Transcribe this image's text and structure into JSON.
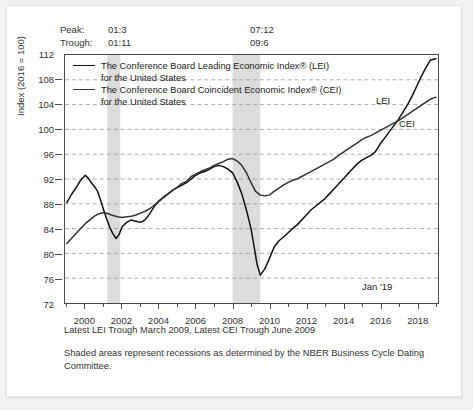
{
  "header": {
    "rows": [
      {
        "label": "Peak:",
        "col1": "01:3",
        "col2": "07:12"
      },
      {
        "label": "Trough:",
        "col1": "01:11",
        "col2": "09:6"
      }
    ]
  },
  "legend": {
    "entries": [
      {
        "line1": "The Conference Board Leading Economic Index® (LEI)",
        "line2": "for the United States",
        "color": "#111111"
      },
      {
        "line1": "The Conference Board Coincident Economic Index® (CEI)",
        "line2": "for the United States",
        "color": "#333333"
      }
    ]
  },
  "annotations": {
    "lei_tag": "LEI",
    "cei_tag": "CEI",
    "last_point": "Jan '19"
  },
  "footnotes": {
    "line1": "Latest LEI Trough March 2009, Latest CEI Trough June 2009",
    "line2": "Shaded areas represent recessions as determined by the NBER Business Cycle Dating Committee."
  },
  "chart_data": {
    "type": "line",
    "title": "",
    "xlabel": "",
    "ylabel": "Index (2016 = 100)",
    "xlim": [
      1998.9,
      2019.15
    ],
    "ylim": [
      72,
      112
    ],
    "yticks": [
      72,
      76,
      80,
      84,
      88,
      92,
      96,
      100,
      104,
      108,
      112
    ],
    "xticks": [
      2000,
      2002,
      2004,
      2006,
      2008,
      2010,
      2012,
      2014,
      2016,
      2018
    ],
    "grid": "horizontal-dashed",
    "legend_position": "inside-top-left",
    "shaded_regions": [
      {
        "name": "recession-2001",
        "x0": 2001.2,
        "x1": 2001.9,
        "color": "#dcdcdc"
      },
      {
        "name": "recession-2008",
        "x0": 2008.0,
        "x1": 2009.5,
        "color": "#dcdcdc"
      }
    ],
    "series": [
      {
        "name": "LEI",
        "color": "#111111",
        "width": 1.5,
        "x": [
          1999.0,
          1999.25,
          1999.5,
          1999.75,
          2000.0,
          2000.17,
          2000.33,
          2000.5,
          2000.67,
          2000.83,
          2001.0,
          2001.17,
          2001.33,
          2001.5,
          2001.67,
          2001.83,
          2002.0,
          2002.25,
          2002.5,
          2002.75,
          2003.0,
          2003.25,
          2003.5,
          2003.75,
          2004.0,
          2004.25,
          2004.5,
          2004.75,
          2005.0,
          2005.25,
          2005.5,
          2005.75,
          2006.0,
          2006.25,
          2006.5,
          2006.75,
          2007.0,
          2007.25,
          2007.5,
          2007.75,
          2008.0,
          2008.25,
          2008.5,
          2008.75,
          2009.0,
          2009.17,
          2009.33,
          2009.5,
          2009.75,
          2010.0,
          2010.25,
          2010.5,
          2010.75,
          2011.0,
          2011.25,
          2011.5,
          2011.75,
          2012.0,
          2012.25,
          2012.5,
          2012.75,
          2013.0,
          2013.25,
          2013.5,
          2013.75,
          2014.0,
          2014.25,
          2014.5,
          2014.75,
          2015.0,
          2015.25,
          2015.5,
          2015.75,
          2016.0,
          2016.25,
          2016.5,
          2016.75,
          2017.0,
          2017.25,
          2017.5,
          2017.75,
          2018.0,
          2018.25,
          2018.5,
          2018.75,
          2019.04
        ],
        "y": [
          88.2,
          89.5,
          90.6,
          91.8,
          92.6,
          92.1,
          91.4,
          90.8,
          90.0,
          88.6,
          87.0,
          85.5,
          84.2,
          83.2,
          82.4,
          83.0,
          84.3,
          85.0,
          85.4,
          85.2,
          85.0,
          85.4,
          86.4,
          87.6,
          88.5,
          89.1,
          89.6,
          90.2,
          90.6,
          91.0,
          91.4,
          92.0,
          92.6,
          93.0,
          93.2,
          93.6,
          94.0,
          94.2,
          94.0,
          93.6,
          93.0,
          91.5,
          89.6,
          87.0,
          84.0,
          81.0,
          78.2,
          76.5,
          77.5,
          79.2,
          81.0,
          82.0,
          82.6,
          83.3,
          84.0,
          84.6,
          85.4,
          86.2,
          87.0,
          87.6,
          88.2,
          88.8,
          89.6,
          90.4,
          91.2,
          92.0,
          92.8,
          93.6,
          94.4,
          95.0,
          95.4,
          95.8,
          96.4,
          97.6,
          98.6,
          99.6,
          100.6,
          101.6,
          102.8,
          104.0,
          105.4,
          107.0,
          108.6,
          110.0,
          111.2,
          111.4
        ]
      },
      {
        "name": "CEI",
        "color": "#333333",
        "width": 1.5,
        "x": [
          1999.0,
          1999.25,
          1999.5,
          1999.75,
          2000.0,
          2000.25,
          2000.5,
          2000.75,
          2001.0,
          2001.25,
          2001.5,
          2001.75,
          2002.0,
          2002.25,
          2002.5,
          2002.75,
          2003.0,
          2003.25,
          2003.5,
          2003.75,
          2004.0,
          2004.25,
          2004.5,
          2004.75,
          2005.0,
          2005.25,
          2005.5,
          2005.75,
          2006.0,
          2006.25,
          2006.5,
          2006.75,
          2007.0,
          2007.25,
          2007.5,
          2007.75,
          2008.0,
          2008.25,
          2008.5,
          2008.75,
          2009.0,
          2009.25,
          2009.5,
          2009.75,
          2010.0,
          2010.25,
          2010.5,
          2010.75,
          2011.0,
          2011.25,
          2011.5,
          2011.75,
          2012.0,
          2012.25,
          2012.5,
          2012.75,
          2013.0,
          2013.25,
          2013.5,
          2013.75,
          2014.0,
          2014.25,
          2014.5,
          2014.75,
          2015.0,
          2015.25,
          2015.5,
          2015.75,
          2016.0,
          2016.25,
          2016.5,
          2016.75,
          2017.0,
          2017.25,
          2017.5,
          2017.75,
          2018.0,
          2018.25,
          2018.5,
          2018.75,
          2019.04
        ],
        "y": [
          81.6,
          82.4,
          83.2,
          84.0,
          84.8,
          85.4,
          86.0,
          86.4,
          86.6,
          86.4,
          86.1,
          85.9,
          85.8,
          85.9,
          86.0,
          86.2,
          86.5,
          86.8,
          87.2,
          87.8,
          88.4,
          89.0,
          89.6,
          90.2,
          90.7,
          91.3,
          91.6,
          92.4,
          92.8,
          93.2,
          93.5,
          93.8,
          94.2,
          94.5,
          94.8,
          95.2,
          95.3,
          94.9,
          94.2,
          93.0,
          91.4,
          90.0,
          89.4,
          89.3,
          89.4,
          90.0,
          90.5,
          91.0,
          91.4,
          91.8,
          92.0,
          92.4,
          92.8,
          93.2,
          93.6,
          94.0,
          94.4,
          94.8,
          95.2,
          95.8,
          96.3,
          96.8,
          97.3,
          97.8,
          98.3,
          98.7,
          99.0,
          99.4,
          99.8,
          100.2,
          100.6,
          101.0,
          101.4,
          101.9,
          102.4,
          102.9,
          103.4,
          103.9,
          104.4,
          104.9,
          105.2
        ]
      }
    ]
  }
}
